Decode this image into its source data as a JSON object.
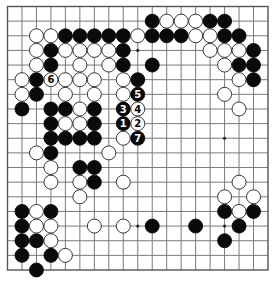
{
  "diagram": {
    "type": "go-board",
    "size": 19,
    "colors": {
      "background": "#ffffff",
      "grid": "#7a7a7a",
      "black_stone": "#0a0a0a",
      "white_stone": "#ffffff"
    },
    "star_points_visible": [
      [
        9,
        3
      ],
      [
        9,
        9
      ],
      [
        15,
        9
      ],
      [
        9,
        15
      ],
      [
        15,
        15
      ]
    ],
    "black_stones": [
      [
        10,
        1
      ],
      [
        14,
        1
      ],
      [
        15,
        1
      ],
      [
        4,
        2
      ],
      [
        5,
        2
      ],
      [
        6,
        2
      ],
      [
        7,
        2
      ],
      [
        8,
        2
      ],
      [
        10,
        2
      ],
      [
        11,
        2
      ],
      [
        12,
        2
      ],
      [
        15,
        2
      ],
      [
        16,
        2
      ],
      [
        3,
        3
      ],
      [
        8,
        3
      ],
      [
        17,
        3
      ],
      [
        3,
        4
      ],
      [
        8,
        4
      ],
      [
        10,
        4
      ],
      [
        16,
        4
      ],
      [
        17,
        4
      ],
      [
        2,
        5
      ],
      [
        9,
        5
      ],
      [
        17,
        5
      ],
      [
        2,
        6
      ],
      [
        1,
        7
      ],
      [
        3,
        7
      ],
      [
        4,
        7
      ],
      [
        6,
        7
      ],
      [
        3,
        8
      ],
      [
        6,
        8
      ],
      [
        3,
        9
      ],
      [
        4,
        9
      ],
      [
        5,
        9
      ],
      [
        6,
        9
      ],
      [
        3,
        10
      ],
      [
        5,
        11
      ],
      [
        6,
        11
      ],
      [
        6,
        12
      ],
      [
        1,
        14
      ],
      [
        3,
        14
      ],
      [
        15,
        14
      ],
      [
        17,
        14
      ],
      [
        1,
        15
      ],
      [
        10,
        15
      ],
      [
        13,
        15
      ],
      [
        16,
        15
      ],
      [
        1,
        16
      ],
      [
        2,
        16
      ],
      [
        15,
        16
      ],
      [
        1,
        17
      ],
      [
        3,
        17
      ],
      [
        2,
        18
      ]
    ],
    "white_stones": [
      [
        11,
        1
      ],
      [
        12,
        1
      ],
      [
        13,
        1
      ],
      [
        2,
        2
      ],
      [
        3,
        2
      ],
      [
        9,
        2
      ],
      [
        13,
        2
      ],
      [
        14,
        2
      ],
      [
        2,
        3
      ],
      [
        4,
        3
      ],
      [
        5,
        3
      ],
      [
        6,
        3
      ],
      [
        7,
        3
      ],
      [
        14,
        3
      ],
      [
        15,
        3
      ],
      [
        16,
        3
      ],
      [
        2,
        4
      ],
      [
        5,
        4
      ],
      [
        7,
        4
      ],
      [
        15,
        4
      ],
      [
        1,
        5
      ],
      [
        4,
        5
      ],
      [
        5,
        5
      ],
      [
        6,
        5
      ],
      [
        8,
        5
      ],
      [
        16,
        5
      ],
      [
        1,
        6
      ],
      [
        4,
        6
      ],
      [
        6,
        6
      ],
      [
        8,
        6
      ],
      [
        15,
        6
      ],
      [
        5,
        7
      ],
      [
        16,
        7
      ],
      [
        4,
        8
      ],
      [
        5,
        8
      ],
      [
        8,
        9
      ],
      [
        2,
        10
      ],
      [
        7,
        10
      ],
      [
        3,
        11
      ],
      [
        3,
        12
      ],
      [
        5,
        12
      ],
      [
        8,
        12
      ],
      [
        16,
        12
      ],
      [
        5,
        13
      ],
      [
        15,
        13
      ],
      [
        17,
        13
      ],
      [
        2,
        14
      ],
      [
        16,
        14
      ],
      [
        2,
        15
      ],
      [
        3,
        15
      ],
      [
        6,
        15
      ],
      [
        8,
        15
      ],
      [
        3,
        16
      ],
      [
        4,
        17
      ]
    ],
    "numbered_moves": [
      {
        "n": "1",
        "color": "black",
        "col": 8,
        "row": 8
      },
      {
        "n": "2",
        "color": "white",
        "col": 9,
        "row": 8
      },
      {
        "n": "3",
        "color": "black",
        "col": 8,
        "row": 7
      },
      {
        "n": "4",
        "color": "white",
        "col": 9,
        "row": 7
      },
      {
        "n": "5",
        "color": "black",
        "col": 9,
        "row": 6
      },
      {
        "n": "6",
        "color": "white",
        "col": 3,
        "row": 5
      },
      {
        "n": "7",
        "color": "black",
        "col": 9,
        "row": 9
      }
    ]
  }
}
